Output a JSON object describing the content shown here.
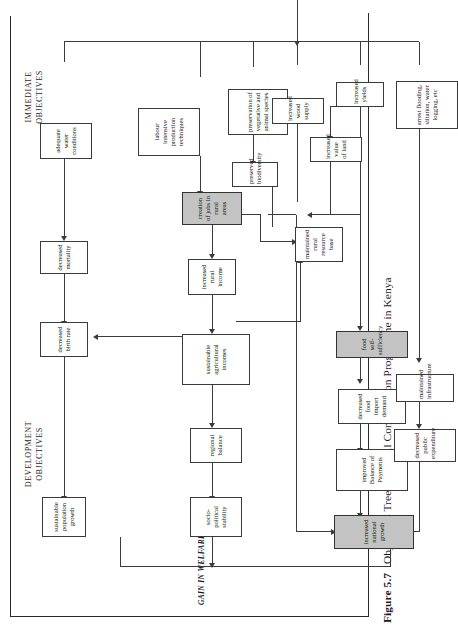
{
  "figure": {
    "number": "Figure 5.7",
    "title": "Objectives Tree for a Soil Conservation Programme in Kenya",
    "welfare_label": "GAIN IN WELFARE"
  },
  "columns": [
    {
      "id": "development",
      "line1": "DEVELOPMENT",
      "line2": "OBJECTIVES"
    },
    {
      "id": "immediate",
      "line1": "IMMEDIATE",
      "line2": "OBJECTIVES"
    }
  ],
  "colors": {
    "box_fill": "#ffffff",
    "box_shaded_fill": "#c3c3c3",
    "stroke": "#3a3a3a",
    "text": "#121212"
  },
  "nodes": [
    {
      "id": "sustainable-population-growth",
      "label": "sustainable population growth",
      "shaded": false
    },
    {
      "id": "socio-political-stability",
      "label": "socio-political stability",
      "shaded": false
    },
    {
      "id": "increased-national-growth",
      "label": "increased national growth",
      "shaded": true
    },
    {
      "id": "decreased-birth-rate",
      "label": "decreased birth rate",
      "shaded": false
    },
    {
      "id": "decreased-mortality",
      "label": "decreased mortality",
      "shaded": false
    },
    {
      "id": "regional-balance",
      "label": "regional balance",
      "shaded": false
    },
    {
      "id": "sustainable-agricultural-incomes",
      "label": "sustainable agricultural incomes",
      "shaded": false
    },
    {
      "id": "increased-rural-income",
      "label": "increased rural income",
      "shaded": false
    },
    {
      "id": "creation-of-jobs",
      "label": "creation of jobs in rural areas",
      "shaded": true
    },
    {
      "id": "preserved-biodiversity",
      "label": "preserved biodiversity",
      "shaded": false
    },
    {
      "id": "maintained-rural-resource-base",
      "label": "maintained rural resource base",
      "shaded": false
    },
    {
      "id": "improved-balance-of-payments",
      "label": "improved Balance of Payments",
      "shaded": false
    },
    {
      "id": "decreased-food-import-demand",
      "label": "decreased food import demand",
      "shaded": false
    },
    {
      "id": "food-self-sufficiency",
      "label": "food self-sufficiency",
      "shaded": true
    },
    {
      "id": "decreased-public-expenditure",
      "label": "decreased public expenditure",
      "shaded": false
    },
    {
      "id": "maintained-infrastructure",
      "label": "maintained infrastructure",
      "shaded": false
    },
    {
      "id": "increased-value-of-land",
      "label": "increased value of land",
      "shaded": false
    },
    {
      "id": "adequate-water-conditions",
      "label": "adequate water conditions",
      "shaded": false
    },
    {
      "id": "labour-intensive-production",
      "label": "labour intensive production techniques",
      "shaded": false
    },
    {
      "id": "preservation-of-species",
      "label": "preservation of vegetative and animal species",
      "shaded": false
    },
    {
      "id": "increased-wood-supply",
      "label": "increased wood supply",
      "shaded": false
    },
    {
      "id": "increased-yields",
      "label": "increased yields",
      "shaded": false
    },
    {
      "id": "arrest-flooding",
      "label": "arrest flooding, siltation, water logging, etc",
      "shaded": false
    }
  ],
  "edges": [
    {
      "from": "decreased-birth-rate",
      "to": "sustainable-population-growth"
    },
    {
      "from": "decreased-mortality",
      "to": "decreased-birth-rate"
    },
    {
      "from": "adequate-water-conditions",
      "to": "decreased-mortality"
    },
    {
      "from": "increased-rural-income",
      "to": "decreased-birth-rate"
    },
    {
      "from": "regional-balance",
      "to": "socio-political-stability"
    },
    {
      "from": "sustainable-agricultural-incomes",
      "to": "regional-balance"
    },
    {
      "from": "increased-rural-income",
      "to": "sustainable-agricultural-incomes"
    },
    {
      "from": "creation-of-jobs",
      "to": "increased-rural-income"
    },
    {
      "from": "labour-intensive-production",
      "to": "creation-of-jobs"
    },
    {
      "from": "maintained-rural-resource-base",
      "to": "creation-of-jobs"
    },
    {
      "from": "preservation-of-species",
      "to": "preserved-biodiversity"
    },
    {
      "from": "preserved-biodiversity",
      "to": "maintained-rural-resource-base"
    },
    {
      "from": "increased-wood-supply",
      "to": "maintained-rural-resource-base"
    },
    {
      "from": "increased-value-of-land",
      "to": "maintained-rural-resource-base"
    },
    {
      "from": "increased-yields",
      "to": "increased-value-of-land"
    },
    {
      "from": "increased-yields",
      "to": "food-self-sufficiency"
    },
    {
      "from": "food-self-sufficiency",
      "to": "decreased-food-import-demand"
    },
    {
      "from": "decreased-food-import-demand",
      "to": "improved-balance-of-payments"
    },
    {
      "from": "improved-balance-of-payments",
      "to": "increased-national-growth"
    },
    {
      "from": "arrest-flooding",
      "to": "maintained-infrastructure"
    },
    {
      "from": "maintained-infrastructure",
      "to": "decreased-public-expenditure"
    },
    {
      "from": "decreased-public-expenditure",
      "to": "increased-national-growth"
    },
    {
      "from": "maintained-rural-resource-base",
      "to": "increased-national-growth"
    },
    {
      "from": "socio-political-stability",
      "to": "welfare"
    },
    {
      "from": "sustainable-population-growth",
      "to": "welfare"
    },
    {
      "from": "increased-national-growth",
      "to": "welfare"
    }
  ]
}
